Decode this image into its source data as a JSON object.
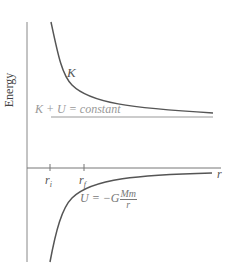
{
  "diagram": {
    "y_axis_label": "Energy",
    "x_axis_label": "r",
    "curves": {
      "kinetic": {
        "label": "K"
      },
      "total": {
        "label": "K + U = constant"
      },
      "potential": {
        "label_lhs": "U = −G",
        "label_num": "Mm",
        "label_den": "r"
      }
    },
    "ticks": [
      {
        "symbol": "r",
        "subscript": "i"
      },
      {
        "symbol": "r",
        "subscript": "f"
      }
    ],
    "colors": {
      "axis": "#777777",
      "curve": "#555555",
      "constant_line": "#999999"
    }
  }
}
